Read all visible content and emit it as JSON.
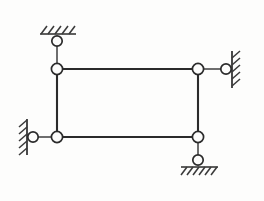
{
  "diagram": {
    "type": "structural-frame",
    "background_color": "#fdfdfc",
    "line_color": "#2b2b2b",
    "link_color": "#4a4a4a",
    "hatch_color": "#3a3a3a",
    "joint_fill": "#fdfdfc",
    "canvas": {
      "width": 264,
      "height": 201
    },
    "joints": [
      {
        "id": "A",
        "label": "top-left-joint",
        "x": 57,
        "y": 69,
        "r": 5.6
      },
      {
        "id": "B",
        "label": "top-right-joint",
        "x": 198,
        "y": 69,
        "r": 5.6
      },
      {
        "id": "C",
        "label": "bottom-left-joint",
        "x": 57,
        "y": 137,
        "r": 5.6
      },
      {
        "id": "D",
        "label": "bottom-right-joint",
        "x": 198,
        "y": 137,
        "r": 5.6
      }
    ],
    "members": [
      {
        "id": "AB",
        "label": "top-chord",
        "x1": 57,
        "y1": 69,
        "x2": 198,
        "y2": 69
      },
      {
        "id": "CD",
        "label": "bottom-chord",
        "x1": 57,
        "y1": 137,
        "x2": 198,
        "y2": 137
      },
      {
        "id": "AC",
        "label": "left-column",
        "x1": 57,
        "y1": 69,
        "x2": 57,
        "y2": 137
      },
      {
        "id": "BD",
        "label": "right-column",
        "x1": 198,
        "y1": 69,
        "x2": 198,
        "y2": 137
      }
    ],
    "supports": [
      {
        "id": "S1",
        "label": "top-support",
        "kind": "pinned-link-to-ceiling",
        "orientation": "vertical",
        "link": {
          "x1": 57,
          "y1": 69,
          "x2": 57,
          "y2": 43
        },
        "pin": {
          "x": 57,
          "y": 41,
          "r": 5.2
        },
        "ground": {
          "x1": 40,
          "y1": 34,
          "x2": 76,
          "y2": 34
        },
        "hatch_side": "above",
        "hatch_count": 5
      },
      {
        "id": "S2",
        "label": "left-support",
        "kind": "pinned-link-to-wall",
        "orientation": "horizontal",
        "link": {
          "x1": 57,
          "y1": 137,
          "x2": 36,
          "y2": 137
        },
        "pin": {
          "x": 33,
          "y": 137,
          "r": 5.2
        },
        "ground": {
          "x1": 27,
          "y1": 119,
          "x2": 27,
          "y2": 155
        },
        "hatch_side": "left",
        "hatch_count": 5
      },
      {
        "id": "S3",
        "label": "right-support",
        "kind": "pinned-link-to-wall",
        "orientation": "horizontal",
        "link": {
          "x1": 198,
          "y1": 69,
          "x2": 222,
          "y2": 69
        },
        "pin": {
          "x": 226,
          "y": 69,
          "r": 5.2
        },
        "ground": {
          "x1": 232,
          "y1": 51,
          "x2": 232,
          "y2": 88
        },
        "hatch_side": "right",
        "hatch_count": 5
      },
      {
        "id": "S4",
        "label": "bottom-support",
        "kind": "pinned-link-to-ground",
        "orientation": "vertical",
        "link": {
          "x1": 198,
          "y1": 137,
          "x2": 198,
          "y2": 157
        },
        "pin": {
          "x": 198,
          "y": 160,
          "r": 5.2
        },
        "ground": {
          "x1": 181,
          "y1": 167,
          "x2": 218,
          "y2": 167
        },
        "hatch_side": "below",
        "hatch_count": 6
      }
    ]
  }
}
